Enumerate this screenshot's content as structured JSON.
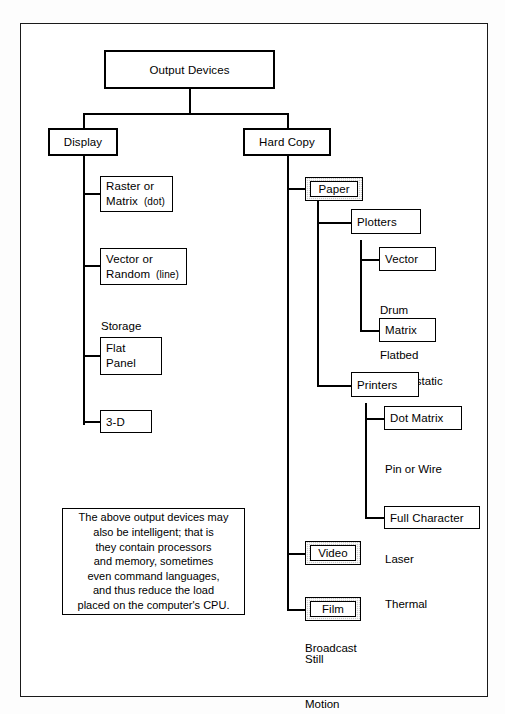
{
  "diagram": {
    "title": "Output Devices",
    "root": {
      "label": "Output Devices"
    },
    "branches": {
      "display": {
        "label": "Display"
      },
      "hard_copy": {
        "label": "Hard Copy"
      }
    },
    "display_children": [
      {
        "label_line1": "Raster or",
        "label_line2": "Matrix",
        "qualifier": "(dot)"
      },
      {
        "label_line1": "Vector or",
        "label_line2": "Random",
        "qualifier": "(line)"
      },
      {
        "label_line1": "Flat",
        "label_line2": "Panel",
        "qualifier": ""
      },
      {
        "label_line1": "3-D",
        "label_line2": "",
        "qualifier": ""
      }
    ],
    "display_captions": [
      {
        "line1": "Storage",
        "line2": "Refresh"
      }
    ],
    "hard_copy_children": [
      {
        "label": "Paper",
        "style": "shaded"
      },
      {
        "label": "Video",
        "style": "shaded"
      },
      {
        "label": "Film",
        "style": "shaded"
      }
    ],
    "paper_children": [
      {
        "label": "Plotters"
      },
      {
        "label": "Printers"
      }
    ],
    "plotters_children": [
      {
        "label": "Vector"
      },
      {
        "label": "Matrix"
      }
    ],
    "plotters_captions": [
      {
        "line1": "Drum",
        "line2": "Flatbed"
      },
      {
        "line1": "Electrostatic",
        "line2": ""
      }
    ],
    "printers_children": [
      {
        "label": "Dot Matrix"
      },
      {
        "label": "Full Character"
      }
    ],
    "printers_captions": [
      {
        "line1": "Pin or Wire",
        "line2": "Ink Jet",
        "line3": "Laser",
        "line4": "Thermal"
      }
    ],
    "video_caption": {
      "line1": "Digitizers",
      "line2": "Broadcast"
    },
    "film_caption": {
      "line1": "Still",
      "line2": "Motion"
    },
    "note": {
      "lines": [
        "The above output devices may",
        "also be intelligent; that is",
        "they contain processors",
        "and memory, sometimes",
        "even command languages,",
        "and thus reduce the load",
        "placed on the computer's CPU."
      ]
    },
    "colors": {
      "line": "#000000",
      "box_fill": "#ffffff",
      "shaded_fill": "#c9c9c9",
      "frame": "#1a1a1a"
    }
  }
}
